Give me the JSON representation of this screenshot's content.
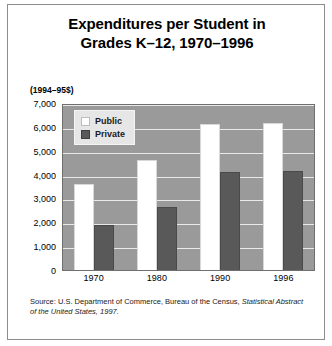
{
  "chart_data": {
    "type": "bar",
    "title_line1": "Expenditures per Student in",
    "title_line2": "Grades K–12, 1970–1996",
    "units_note": "(1994–95$)",
    "categories": [
      "1970",
      "1980",
      "1990",
      "1996"
    ],
    "series": [
      {
        "name": "Public",
        "color": "#ffffff",
        "values": [
          3600,
          4600,
          6100,
          6150
        ]
      },
      {
        "name": "Private",
        "color": "#595959",
        "values": [
          1900,
          2650,
          4100,
          4150
        ]
      }
    ],
    "xlabel": "",
    "ylabel": "",
    "ylim": [
      0,
      7000
    ],
    "ytick_values": [
      7000,
      6000,
      5000,
      4000,
      3000,
      2000,
      1000,
      0
    ],
    "ytick_labels": [
      "7,000",
      "6,000",
      "5,000",
      "4,000",
      "3,000",
      "2,000",
      "1,000",
      "0"
    ],
    "grid": true,
    "legend_position": "upper-left-inside",
    "plot_background": "#9a9a9a",
    "gridline_color": "#e9e9e9"
  },
  "source": {
    "prefix": "Source: U.S. Department of Commerce, Bureau of the Census, ",
    "italic": "Statistical Abstract of the United States, 1997."
  }
}
